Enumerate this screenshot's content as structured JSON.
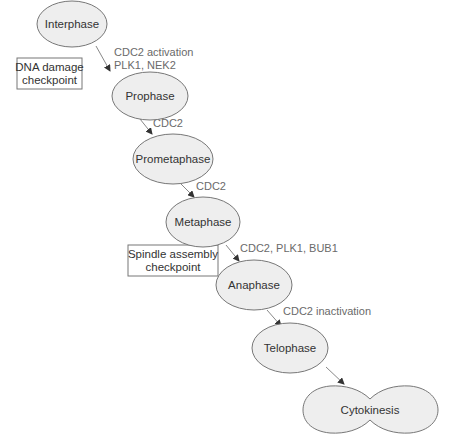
{
  "diagram": {
    "type": "cell-cycle-flow",
    "nodes": [
      {
        "id": "interphase",
        "label": "Interphase"
      },
      {
        "id": "prophase",
        "label": "Prophase"
      },
      {
        "id": "prometaphase",
        "label": "Prometaphase"
      },
      {
        "id": "metaphase",
        "label": "Metaphase"
      },
      {
        "id": "anaphase",
        "label": "Anaphase"
      },
      {
        "id": "telophase",
        "label": "Telophase"
      },
      {
        "id": "cytokinesis",
        "label": "Cytokinesis"
      }
    ],
    "edges": [
      {
        "from": "interphase",
        "to": "prophase",
        "label_line1": "CDC2 activation",
        "label_line2": "PLK1, NEK2"
      },
      {
        "from": "prophase",
        "to": "prometaphase",
        "label_line1": "CDC2"
      },
      {
        "from": "prometaphase",
        "to": "metaphase",
        "label_line1": "CDC2"
      },
      {
        "from": "metaphase",
        "to": "anaphase",
        "label_line1": "CDC2, PLK1, BUB1"
      },
      {
        "from": "anaphase",
        "to": "telophase",
        "label_line1": "CDC2 inactivation"
      },
      {
        "from": "telophase",
        "to": "cytokinesis"
      }
    ],
    "checkpoints": [
      {
        "id": "dna-damage",
        "line1": "DNA damage",
        "line2": "checkpoint"
      },
      {
        "id": "spindle-assembly",
        "line1": "Spindle assembly",
        "line2": "checkpoint"
      }
    ],
    "colors": {
      "node_fill": "#eeeeee",
      "node_stroke": "#777777",
      "edge": "#888888",
      "edge_label": "#6a6a6a",
      "node_text": "#333333"
    }
  }
}
